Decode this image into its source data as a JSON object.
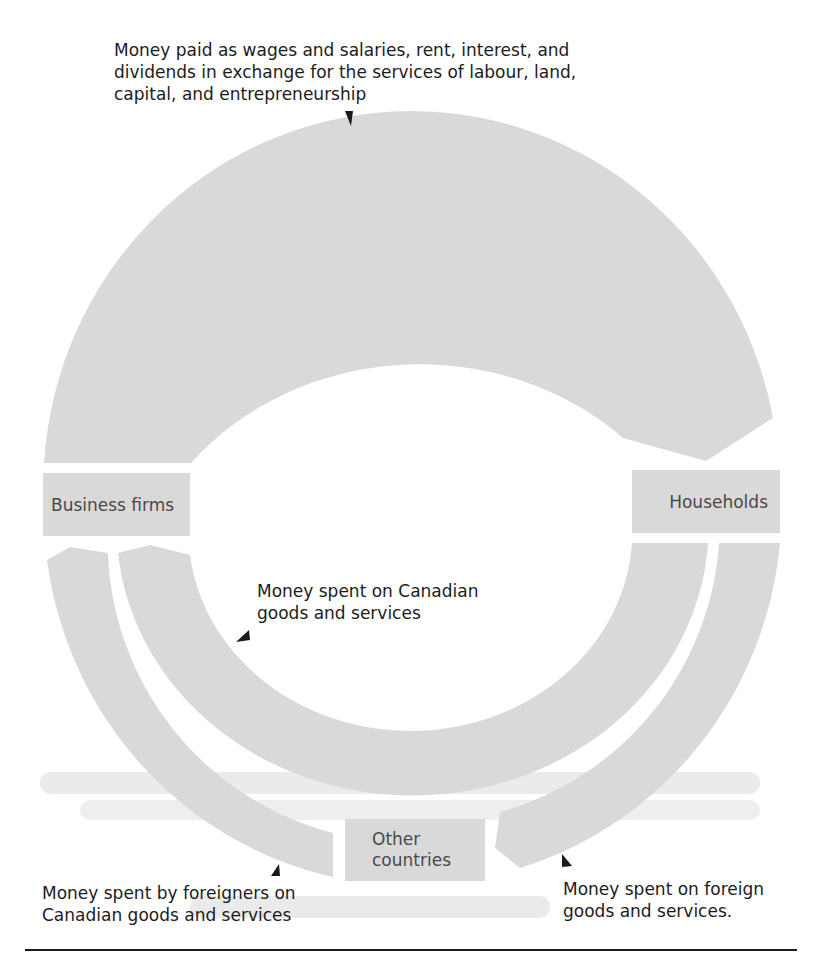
{
  "figure": {
    "nodes": {
      "business_firms": "Business firms",
      "households": "Households",
      "other_countries_line1": "Other",
      "other_countries_line2": "countries"
    },
    "flows": {
      "factor_payments": "Money paid as wages and salaries, rent, interest, and\ndividends in exchange for the services of labour, land,\ncapital, and entrepreneurship",
      "domestic_spending": "Money spent on Canadian\ngoods and services",
      "exports": "Money spent by foreigners on\nCanadian goods and services",
      "imports": "Money spent on foreign\ngoods and services."
    },
    "colors": {
      "band": "#d9d9d9",
      "text": "#1c1c1c",
      "box_text": "#4a4a4a",
      "arrow": "#1a1a1a"
    }
  }
}
